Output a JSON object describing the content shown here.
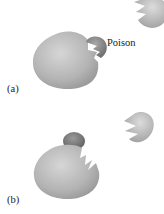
{
  "panels": [
    {
      "id": "a",
      "label": "(a)",
      "annotation": "Poison"
    },
    {
      "id": "b",
      "label": "(b)"
    }
  ],
  "colors": {
    "enzyme_light": "#d2d2d2",
    "enzyme_dark": "#9a9a9a",
    "poison_dark": "#777777",
    "knob_dark": "#6f6f6f"
  }
}
